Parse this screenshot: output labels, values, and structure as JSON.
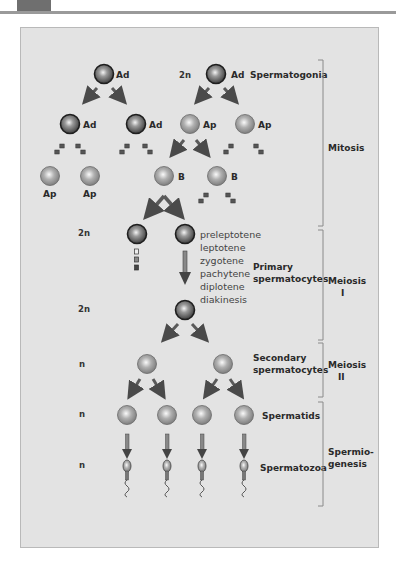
{
  "diagram": {
    "cell_labels": {
      "ad": "Ad",
      "ap": "Ap",
      "b": "B"
    },
    "ploidy": [
      "2n",
      "2n",
      "2n",
      "n",
      "n",
      "n"
    ],
    "stages": {
      "spermatogonia": "Spermatogonia",
      "primary_line1": "Primary",
      "primary_line2": "spermatocytes",
      "secondary_line1": "Secondary",
      "secondary_line2": "spermatocytes",
      "spermatids": "Spermatids",
      "spermatozoa": "Spermatozoa"
    },
    "prophase_substages": [
      "preleptotene",
      "leptotene",
      "zygotene",
      "pachytene",
      "diplotene",
      "diakinesis"
    ],
    "phases": {
      "mitosis": "Mitosis",
      "meiosis1_line1": "Meiosis",
      "meiosis1_line2": "I",
      "meiosis2_line1": "Meiosis",
      "meiosis2_line2": "II",
      "spermio_line1": "Spermio-",
      "spermio_line2": "genesis"
    },
    "colors": {
      "panel_bg": "#e3e3e3",
      "dark_cell": "#2e2e2e",
      "light_cell": "#8c8c8c",
      "arrow": "#5a5a5a",
      "bracket": "#8a8a8a"
    }
  }
}
